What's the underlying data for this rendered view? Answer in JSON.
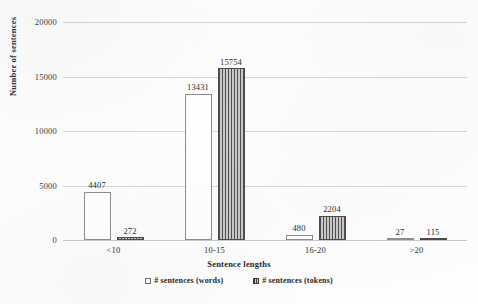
{
  "chart_data": {
    "type": "bar",
    "title": "",
    "xlabel": "Sentence lengths",
    "ylabel": "Number of sentences",
    "categories": [
      "<10",
      "10-15",
      "16-20",
      ">20"
    ],
    "series": [
      {
        "name": "# sentences (words)",
        "values": [
          4407,
          13431,
          480,
          27
        ]
      },
      {
        "name": "# sentences (tokens)",
        "values": [
          272,
          15754,
          2204,
          115
        ]
      }
    ],
    "ylim": [
      0,
      20000
    ],
    "yticks": [
      0,
      5000,
      10000,
      15000,
      20000
    ],
    "ytick_labels": [
      "0",
      "5000",
      "10000",
      "15000",
      "20000"
    ],
    "grid": true,
    "legend_position": "bottom",
    "colors": {
      "words_fill": "#ffffff",
      "words_edge": "#8c8c8c",
      "tokens_fill": "#b9b9b9",
      "tokens_stripe": "#4f4f4f",
      "gridline": "#d6d6d6",
      "text": "#2b2b2b",
      "background": "#fdfdfd"
    },
    "data_labels": {
      "words": [
        "4407",
        "13431",
        "480",
        "27"
      ],
      "tokens": [
        "272",
        "15754",
        "2204",
        "115"
      ]
    }
  }
}
